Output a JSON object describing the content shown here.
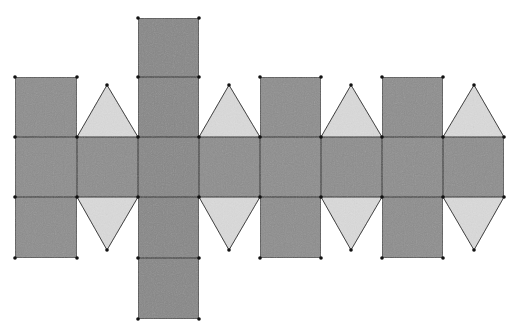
{
  "diagram": {
    "colors": {
      "square_fill": "#8d8d8d",
      "column_fill": "#878787",
      "triangle_fill": "#dadada",
      "edge": "#2a2a2a",
      "vertex": "#111111",
      "background": "#ffffff"
    },
    "grid": {
      "xs": [
        15,
        77,
        138,
        199,
        260,
        321,
        382,
        443,
        504
      ],
      "ys": [
        18,
        77,
        137,
        197,
        258,
        319
      ]
    },
    "squares": [
      {
        "name": "column-top-square",
        "x0": 138,
        "y0": 18,
        "x1": 199,
        "y1": 77,
        "fill": "column"
      },
      {
        "name": "column-upper-square",
        "x0": 138,
        "y0": 77,
        "x1": 199,
        "y1": 137,
        "fill": "column"
      },
      {
        "name": "upper-square-1",
        "x0": 15,
        "y0": 77,
        "x1": 77,
        "y1": 137,
        "fill": "square"
      },
      {
        "name": "upper-square-3",
        "x0": 260,
        "y0": 77,
        "x1": 321,
        "y1": 137,
        "fill": "square"
      },
      {
        "name": "upper-square-4",
        "x0": 382,
        "y0": 77,
        "x1": 443,
        "y1": 137,
        "fill": "square"
      },
      {
        "name": "strip-square-1",
        "x0": 15,
        "y0": 137,
        "x1": 77,
        "y1": 197,
        "fill": "square"
      },
      {
        "name": "strip-square-2",
        "x0": 77,
        "y0": 137,
        "x1": 138,
        "y1": 197,
        "fill": "square"
      },
      {
        "name": "strip-square-3",
        "x0": 138,
        "y0": 137,
        "x1": 199,
        "y1": 197,
        "fill": "column"
      },
      {
        "name": "strip-square-4",
        "x0": 199,
        "y0": 137,
        "x1": 260,
        "y1": 197,
        "fill": "square"
      },
      {
        "name": "strip-square-5",
        "x0": 260,
        "y0": 137,
        "x1": 321,
        "y1": 197,
        "fill": "square"
      },
      {
        "name": "strip-square-6",
        "x0": 321,
        "y0": 137,
        "x1": 382,
        "y1": 197,
        "fill": "square"
      },
      {
        "name": "strip-square-7",
        "x0": 382,
        "y0": 137,
        "x1": 443,
        "y1": 197,
        "fill": "square"
      },
      {
        "name": "strip-square-8",
        "x0": 443,
        "y0": 137,
        "x1": 504,
        "y1": 197,
        "fill": "square"
      },
      {
        "name": "lower-square-1",
        "x0": 15,
        "y0": 197,
        "x1": 77,
        "y1": 258,
        "fill": "square"
      },
      {
        "name": "column-lower-square",
        "x0": 138,
        "y0": 197,
        "x1": 199,
        "y1": 258,
        "fill": "column"
      },
      {
        "name": "lower-square-3",
        "x0": 260,
        "y0": 197,
        "x1": 321,
        "y1": 258,
        "fill": "square"
      },
      {
        "name": "lower-square-4",
        "x0": 382,
        "y0": 197,
        "x1": 443,
        "y1": 258,
        "fill": "square"
      },
      {
        "name": "column-bottom-square",
        "x0": 138,
        "y0": 258,
        "x1": 199,
        "y1": 319,
        "fill": "column"
      }
    ],
    "triangles": [
      {
        "name": "upper-triangle-1",
        "points": [
          [
            77,
            137
          ],
          [
            138,
            137
          ],
          [
            107,
            85
          ]
        ]
      },
      {
        "name": "upper-triangle-2",
        "points": [
          [
            199,
            137
          ],
          [
            260,
            137
          ],
          [
            229,
            85
          ]
        ]
      },
      {
        "name": "upper-triangle-3",
        "points": [
          [
            321,
            137
          ],
          [
            382,
            137
          ],
          [
            351,
            85
          ]
        ]
      },
      {
        "name": "upper-triangle-4",
        "points": [
          [
            443,
            137
          ],
          [
            504,
            137
          ],
          [
            474,
            85
          ]
        ]
      },
      {
        "name": "lower-triangle-1",
        "points": [
          [
            77,
            197
          ],
          [
            138,
            197
          ],
          [
            107,
            250
          ]
        ]
      },
      {
        "name": "lower-triangle-2",
        "points": [
          [
            199,
            197
          ],
          [
            260,
            197
          ],
          [
            229,
            250
          ]
        ]
      },
      {
        "name": "lower-triangle-3",
        "points": [
          [
            321,
            197
          ],
          [
            382,
            197
          ],
          [
            351,
            250
          ]
        ]
      },
      {
        "name": "lower-triangle-4",
        "points": [
          [
            443,
            197
          ],
          [
            504,
            197
          ],
          [
            474,
            250
          ]
        ]
      }
    ],
    "vertices": [
      [
        138,
        18
      ],
      [
        199,
        18
      ],
      [
        15,
        77
      ],
      [
        77,
        77
      ],
      [
        138,
        77
      ],
      [
        199,
        77
      ],
      [
        260,
        77
      ],
      [
        321,
        77
      ],
      [
        382,
        77
      ],
      [
        443,
        77
      ],
      [
        107,
        85
      ],
      [
        229,
        85
      ],
      [
        351,
        85
      ],
      [
        474,
        85
      ],
      [
        15,
        137
      ],
      [
        77,
        137
      ],
      [
        138,
        137
      ],
      [
        199,
        137
      ],
      [
        260,
        137
      ],
      [
        321,
        137
      ],
      [
        382,
        137
      ],
      [
        443,
        137
      ],
      [
        504,
        137
      ],
      [
        15,
        197
      ],
      [
        77,
        197
      ],
      [
        138,
        197
      ],
      [
        199,
        197
      ],
      [
        260,
        197
      ],
      [
        321,
        197
      ],
      [
        382,
        197
      ],
      [
        443,
        197
      ],
      [
        504,
        197
      ],
      [
        107,
        250
      ],
      [
        229,
        250
      ],
      [
        351,
        250
      ],
      [
        474,
        250
      ],
      [
        15,
        258
      ],
      [
        77,
        258
      ],
      [
        138,
        258
      ],
      [
        199,
        258
      ],
      [
        260,
        258
      ],
      [
        321,
        258
      ],
      [
        382,
        258
      ],
      [
        443,
        258
      ],
      [
        138,
        319
      ],
      [
        199,
        319
      ]
    ]
  }
}
